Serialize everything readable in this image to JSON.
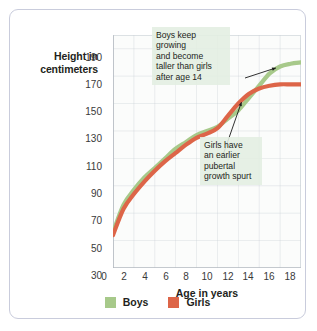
{
  "chart_data": {
    "type": "line",
    "title": "",
    "xlabel": "Age in years",
    "ylabel": "Height in centimeters",
    "ylabel_lines": [
      "Height in",
      "centimeters"
    ],
    "xlim": [
      0,
      18
    ],
    "ylim": [
      30,
      200
    ],
    "grid": true,
    "xticks": [
      "0",
      "2",
      "4",
      "6",
      "8",
      "10",
      "12",
      "14",
      "16",
      "18"
    ],
    "yticks": [
      "190",
      "170",
      "150",
      "130",
      "110",
      "90",
      "70",
      "50",
      "30"
    ],
    "x": [
      0,
      1,
      2,
      3,
      4,
      5,
      6,
      7,
      8,
      9,
      10,
      11,
      12,
      13,
      14,
      15,
      16,
      17,
      18
    ],
    "series": [
      {
        "name": "Boys",
        "color": "#a7c98a",
        "values": [
          56,
          76,
          87,
          96,
          103,
          110,
          117,
          122,
          127,
          130,
          133,
          139,
          145,
          154,
          163,
          172,
          177,
          179,
          180
        ]
      },
      {
        "name": "Girls",
        "color": "#dd6548",
        "values": [
          54,
          73,
          84,
          93,
          101,
          108,
          114,
          120,
          125,
          128,
          132,
          141,
          150,
          157,
          161,
          163,
          164,
          164,
          164
        ]
      }
    ],
    "legend_position": "bottom",
    "annotations": [
      {
        "id": "boys-note",
        "text": "Boys keep growing\nand become\ntaller than girls\nafter age 14",
        "points_to": {
          "x": 16,
          "y": 177
        }
      },
      {
        "id": "girls-note",
        "text": "Girls have\nan earlier\npubertal\ngrowth spurt",
        "points_to": {
          "x": 12.4,
          "y": 152
        }
      }
    ]
  },
  "legend": {
    "items": [
      {
        "label": "Boys",
        "color": "#a7c98a"
      },
      {
        "label": "Girls",
        "color": "#dd6548"
      }
    ]
  },
  "colors": {
    "boys": "#a7c98a",
    "girls": "#dd6548",
    "grid": "#c6cdd4",
    "plot_background": "#fbfcfb",
    "annotation_background": "#e2eee1",
    "frame_border": "#c9ccdc",
    "text": "#231f20"
  }
}
